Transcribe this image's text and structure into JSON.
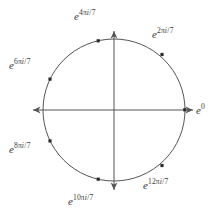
{
  "figure": {
    "width": 224,
    "height": 219,
    "background_color": "#ffffff",
    "stroke_color": "#555555",
    "text_color": "#3a3a3a"
  },
  "circle": {
    "center_x": 114,
    "center_y": 110,
    "radius": 71,
    "stroke_color": "#555555",
    "stroke_width": 1
  },
  "axes": {
    "horizontal": {
      "x1": 33,
      "y1": 110,
      "x2": 193,
      "y2": 110
    },
    "vertical": {
      "x1": 114,
      "y1": 31,
      "x2": 114,
      "y2": 190
    },
    "arrowheads": [
      "left",
      "right",
      "up",
      "down"
    ],
    "stroke_color": "#555555"
  },
  "points": [
    {
      "name": "root-0",
      "k": 0,
      "angle_deg": 0,
      "x": 185,
      "y": 110
    },
    {
      "name": "root-1",
      "k": 1,
      "angle_deg": 51.43,
      "x": 162,
      "y": 54.5
    },
    {
      "name": "root-2",
      "k": 2,
      "angle_deg": 102.86,
      "x": 98.2,
      "y": 40.8
    },
    {
      "name": "root-3",
      "k": 3,
      "angle_deg": 154.29,
      "x": 50,
      "y": 79.1
    },
    {
      "name": "root-4",
      "k": 4,
      "angle_deg": 205.71,
      "x": 50,
      "y": 140.9
    },
    {
      "name": "root-5",
      "k": 5,
      "angle_deg": 257.14,
      "x": 98.2,
      "y": 179.2
    },
    {
      "name": "root-6",
      "k": 6,
      "angle_deg": 308.57,
      "x": 162,
      "y": 165.5
    }
  ],
  "labels": {
    "e0": {
      "base": "e",
      "exponent_num": "0",
      "has_pi_i_over_7": false,
      "left": 196,
      "top": 103
    },
    "e2pi": {
      "base": "e",
      "exponent_num": "2",
      "has_pi_i_over_7": true,
      "left": 152,
      "top": 27
    },
    "e4pi": {
      "base": "e",
      "exponent_num": "4",
      "has_pi_i_over_7": true,
      "left": 74,
      "top": 9
    },
    "e6pi": {
      "base": "e",
      "exponent_num": "6",
      "has_pi_i_over_7": true,
      "left": 9,
      "top": 58
    },
    "e8pi": {
      "base": "e",
      "exponent_num": "8",
      "has_pi_i_over_7": true,
      "left": 9,
      "top": 142
    },
    "e10pi": {
      "base": "e",
      "exponent_num": "10",
      "has_pi_i_over_7": true,
      "left": 68,
      "top": 194
    },
    "e12pi": {
      "base": "e",
      "exponent_num": "12",
      "has_pi_i_over_7": true,
      "left": 143,
      "top": 178
    }
  },
  "symbols": {
    "pi": "π",
    "i": "i",
    "slash": "/",
    "seven": "7"
  }
}
